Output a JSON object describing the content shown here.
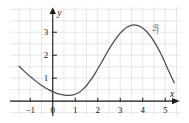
{
  "figure": {
    "background_color": "#ffffff",
    "grid_color": "#d9d9de",
    "axis_color": "#1a1a1a",
    "curve_color": "#4d4d4d"
  },
  "chart_data": {
    "type": "line",
    "title": "",
    "subtitle": "",
    "xlabel": "x",
    "ylabel": "y",
    "xlim": [
      -1.9,
      5.7
    ],
    "ylim": [
      -0.65,
      4.1
    ],
    "grid": true,
    "grid_step_x": 0.5,
    "grid_step_y": 0.5,
    "legend_position": "inline-curve-label",
    "x_ticks": [
      -1,
      0,
      1,
      2,
      3,
      4,
      5
    ],
    "x_tick_labels": [
      "−1",
      "0",
      "1",
      "2",
      "3",
      "4",
      "5"
    ],
    "y_ticks": [
      1,
      2,
      3
    ],
    "y_tick_labels": [
      "1",
      "2",
      "3"
    ],
    "annotations": [
      {
        "name": "curve-label",
        "text": "ℬ",
        "sub": "f",
        "x": 4.35,
        "y": 3.05
      }
    ],
    "series": [
      {
        "name": "Cf",
        "color": "#4d4d4d",
        "x": [
          -1.5,
          -1.35,
          -1.2,
          -1.05,
          -0.9,
          -0.75,
          -0.6,
          -0.45,
          -0.3,
          -0.15,
          0.0,
          0.15,
          0.3,
          0.45,
          0.6,
          0.75,
          0.9,
          1.05,
          1.2,
          1.35,
          1.5,
          1.65,
          1.8,
          1.95,
          2.1,
          2.25,
          2.4,
          2.55,
          2.7,
          2.85,
          3.0,
          3.15,
          3.3,
          3.45,
          3.6,
          3.75,
          3.9,
          4.05,
          4.2,
          4.35,
          4.5,
          4.65,
          4.8,
          4.95,
          5.1,
          5.25,
          5.4
        ],
        "y": [
          1.52,
          1.38,
          1.24,
          1.11,
          0.99,
          0.87,
          0.76,
          0.66,
          0.56,
          0.48,
          0.41,
          0.35,
          0.3,
          0.27,
          0.25,
          0.25,
          0.27,
          0.32,
          0.4,
          0.52,
          0.68,
          0.87,
          1.08,
          1.32,
          1.57,
          1.83,
          2.09,
          2.34,
          2.57,
          2.78,
          2.96,
          3.11,
          3.22,
          3.29,
          3.32,
          3.3,
          3.24,
          3.14,
          3.0,
          2.82,
          2.6,
          2.35,
          2.07,
          1.76,
          1.43,
          1.1,
          0.8
        ]
      }
    ]
  }
}
